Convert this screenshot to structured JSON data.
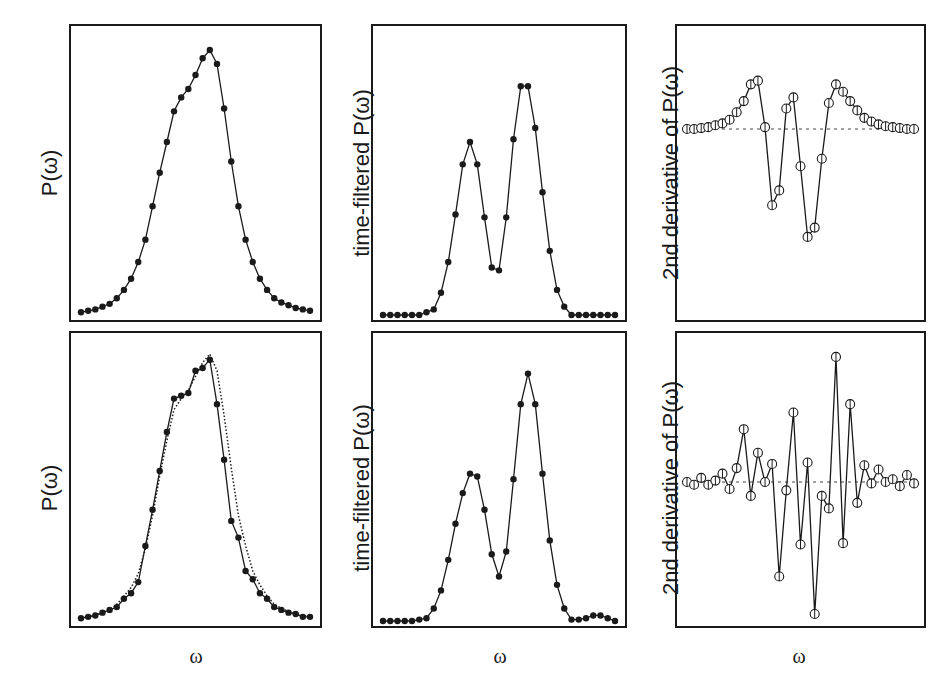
{
  "chart_data": [
    {
      "id": "top-left",
      "type": "line",
      "marker": "filled-circle",
      "ylabel": "P(ω)",
      "xlabel": "",
      "n_points": 33,
      "series": [
        {
          "name": "P(ω)",
          "style": "solid",
          "values": [
            0.01,
            0.015,
            0.02,
            0.03,
            0.04,
            0.06,
            0.09,
            0.13,
            0.19,
            0.27,
            0.39,
            0.51,
            0.62,
            0.73,
            0.78,
            0.81,
            0.86,
            0.92,
            0.95,
            0.9,
            0.74,
            0.55,
            0.39,
            0.27,
            0.19,
            0.13,
            0.09,
            0.06,
            0.045,
            0.035,
            0.025,
            0.02,
            0.015
          ]
        }
      ],
      "grid": false
    },
    {
      "id": "top-middle",
      "type": "line",
      "marker": "filled-circle",
      "ylabel": "time-filtered P(ω)",
      "xlabel": "",
      "n_points": 33,
      "series": [
        {
          "name": "time-filtered P(ω)",
          "values": [
            0,
            0,
            0,
            0,
            0,
            0,
            0.01,
            0.02,
            0.08,
            0.19,
            0.36,
            0.54,
            0.62,
            0.54,
            0.35,
            0.17,
            0.16,
            0.35,
            0.63,
            0.82,
            0.82,
            0.67,
            0.44,
            0.23,
            0.09,
            0.03,
            0.0,
            0,
            0,
            0,
            0,
            0,
            0
          ]
        }
      ],
      "grid": false
    },
    {
      "id": "top-right",
      "type": "line",
      "marker": "open-circle",
      "ylabel": "2nd derivative of P(ω)",
      "xlabel": "",
      "n_points": 33,
      "zero_line": {
        "value": 0,
        "style": "dotted"
      },
      "ylim": [
        -1.0,
        0.5
      ],
      "series": [
        {
          "name": "2nd derivative of P(ω)",
          "values": [
            0,
            0,
            0.005,
            0.01,
            0.02,
            0.03,
            0.05,
            0.09,
            0.15,
            0.24,
            0.26,
            0.01,
            -0.41,
            -0.33,
            0.11,
            0.17,
            -0.2,
            -0.58,
            -0.53,
            -0.16,
            0.14,
            0.24,
            0.2,
            0.15,
            0.1,
            0.06,
            0.04,
            0.025,
            0.015,
            0.01,
            0.005,
            0,
            0
          ]
        }
      ],
      "grid": false
    },
    {
      "id": "bottom-left",
      "type": "line",
      "marker": "filled-circle",
      "ylabel": "P(ω)",
      "xlabel": "ω",
      "n_points": 33,
      "series": [
        {
          "name": "noisy P(ω)",
          "style": "solid",
          "values": [
            0.01,
            0.015,
            0.02,
            0.03,
            0.04,
            0.05,
            0.08,
            0.1,
            0.14,
            0.27,
            0.4,
            0.54,
            0.68,
            0.8,
            0.81,
            0.82,
            0.9,
            0.91,
            0.94,
            0.78,
            0.58,
            0.36,
            0.3,
            0.18,
            0.15,
            0.1,
            0.08,
            0.05,
            0.04,
            0.03,
            0.025,
            0.015,
            0.015
          ]
        },
        {
          "name": "smooth P(ω)",
          "style": "dotted",
          "values": [
            0.01,
            0.015,
            0.02,
            0.03,
            0.04,
            0.06,
            0.09,
            0.12,
            0.17,
            0.26,
            0.38,
            0.52,
            0.65,
            0.76,
            0.8,
            0.83,
            0.88,
            0.93,
            0.96,
            0.9,
            0.74,
            0.55,
            0.38,
            0.27,
            0.18,
            0.13,
            0.09,
            0.06,
            0.045,
            0.035,
            0.025,
            0.02,
            0.015
          ]
        }
      ],
      "grid": false
    },
    {
      "id": "bottom-middle",
      "type": "line",
      "marker": "filled-circle",
      "ylabel": "time-filtered P(ω)",
      "xlabel": "ω",
      "n_points": 33,
      "series": [
        {
          "name": "time-filtered P(ω)",
          "values": [
            0,
            0,
            0,
            0,
            0,
            0.005,
            0.01,
            0.045,
            0.11,
            0.22,
            0.35,
            0.46,
            0.53,
            0.52,
            0.4,
            0.24,
            0.16,
            0.25,
            0.51,
            0.78,
            0.89,
            0.78,
            0.53,
            0.29,
            0.13,
            0.045,
            0.005,
            0.005,
            0.01,
            0.02,
            0.02,
            0.01,
            0.0
          ]
        }
      ],
      "grid": false
    },
    {
      "id": "bottom-right",
      "type": "line",
      "marker": "open-circle",
      "ylabel": "2nd derivative of P(ω)",
      "xlabel": "ω",
      "n_points": 33,
      "zero_line": {
        "value": 0,
        "style": "dotted"
      },
      "ylim": [
        -1.0,
        1.0
      ],
      "series": [
        {
          "name": "2nd derivative of P(ω)",
          "values": [
            0.0,
            -0.02,
            0.03,
            -0.02,
            0.01,
            0.06,
            -0.05,
            0.1,
            0.38,
            -0.1,
            0.21,
            0.0,
            0.13,
            -0.68,
            -0.06,
            0.5,
            -0.45,
            0.14,
            -0.95,
            -0.1,
            -0.19,
            0.9,
            -0.44,
            0.56,
            -0.15,
            0.12,
            -0.01,
            0.09,
            0.0,
            0.02,
            -0.03,
            0.05,
            -0.01
          ]
        }
      ],
      "grid": false
    }
  ],
  "labels": {
    "p_omega": "P(ω)",
    "time_filtered": "time-filtered P(ω)",
    "second_derivative": "2nd derivative of P(ω)",
    "omega": "ω"
  },
  "colors": {
    "line": "#1a1a1a",
    "marker_fill": "#1a1a1a",
    "background": "#ffffff"
  }
}
